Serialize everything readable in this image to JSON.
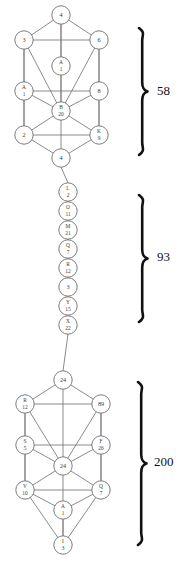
{
  "figure": {
    "background_color": "#ffffff",
    "line_color": "#767676",
    "node_fill": "#ffffff",
    "text_color": "#3a3a3a",
    "brace_color": "#111111"
  },
  "groups": [
    {
      "id": "group-top",
      "name": "upper-tree",
      "layout": "tree-of-life",
      "brace": {
        "glyph": "}",
        "value": "58"
      },
      "nodes": [
        {
          "id": "t1",
          "letter": "",
          "number": "4",
          "label": "4",
          "x": 61,
          "y": 15
        },
        {
          "id": "t2",
          "letter": "",
          "number": "3",
          "label": "3",
          "x": 24,
          "y": 40
        },
        {
          "id": "t3",
          "letter": "",
          "number": "6",
          "label": "6",
          "x": 99,
          "y": 40
        },
        {
          "id": "t4",
          "letter": "A",
          "number": "1",
          "label": "A 1",
          "x": 61,
          "y": 66
        },
        {
          "id": "t5",
          "letter": "A",
          "number": "1",
          "label": "A 1",
          "x": 24,
          "y": 91
        },
        {
          "id": "t6",
          "letter": "",
          "number": "8",
          "label": "8",
          "x": 99,
          "y": 91
        },
        {
          "id": "t7",
          "letter": "B",
          "number": "20",
          "label": "B 20",
          "x": 61,
          "y": 111
        },
        {
          "id": "t8",
          "letter": "",
          "number": "2",
          "label": "2",
          "x": 24,
          "y": 135
        },
        {
          "id": "t9",
          "letter": "K",
          "number": "9",
          "label": "K 9",
          "x": 99,
          "y": 135
        },
        {
          "id": "t10",
          "letter": "",
          "number": "4",
          "label": "4",
          "x": 61,
          "y": 158
        }
      ],
      "edges": [
        [
          "t1",
          "t2"
        ],
        [
          "t1",
          "t3"
        ],
        [
          "t1",
          "t4"
        ],
        [
          "t1",
          "t7"
        ],
        [
          "t2",
          "t3"
        ],
        [
          "t2",
          "t5"
        ],
        [
          "t2",
          "t7"
        ],
        [
          "t2",
          "t8"
        ],
        [
          "t3",
          "t6"
        ],
        [
          "t3",
          "t7"
        ],
        [
          "t3",
          "t9"
        ],
        [
          "t4",
          "t7"
        ],
        [
          "t5",
          "t6"
        ],
        [
          "t5",
          "t7"
        ],
        [
          "t5",
          "t8"
        ],
        [
          "t6",
          "t7"
        ],
        [
          "t6",
          "t9"
        ],
        [
          "t7",
          "t8"
        ],
        [
          "t7",
          "t9"
        ],
        [
          "t7",
          "t10"
        ],
        [
          "t8",
          "t9"
        ],
        [
          "t8",
          "t10"
        ],
        [
          "t9",
          "t10"
        ]
      ]
    },
    {
      "id": "group-middle",
      "name": "middle-chain",
      "layout": "vertical-chain",
      "brace": {
        "glyph": "}",
        "value": "93"
      },
      "nodes": [
        {
          "id": "m1",
          "letter": "L",
          "number": "2",
          "label": "L 2",
          "x": 68,
          "y": 192
        },
        {
          "id": "m2",
          "letter": "O",
          "number": "11",
          "label": "O 11",
          "x": 68,
          "y": 211
        },
        {
          "id": "m3",
          "letter": "M",
          "number": "21",
          "label": "M 21",
          "x": 68,
          "y": 230
        },
        {
          "id": "m4",
          "letter": "Q",
          "number": "7",
          "label": "Q 7",
          "x": 68,
          "y": 249
        },
        {
          "id": "m5",
          "letter": "R",
          "number": "12",
          "label": "R 12",
          "x": 68,
          "y": 268
        },
        {
          "id": "m6",
          "letter": "",
          "number": "3",
          "label": "3",
          "x": 68,
          "y": 287
        },
        {
          "id": "m7",
          "letter": "Y",
          "number": "15",
          "label": "Y 15",
          "x": 68,
          "y": 306
        },
        {
          "id": "m8",
          "letter": "X",
          "number": "22",
          "label": "X 22",
          "x": 68,
          "y": 325
        }
      ],
      "edges": [
        [
          "m1",
          "m2"
        ],
        [
          "m2",
          "m3"
        ],
        [
          "m3",
          "m4"
        ],
        [
          "m4",
          "m5"
        ],
        [
          "m5",
          "m6"
        ],
        [
          "m6",
          "m7"
        ],
        [
          "m7",
          "m8"
        ]
      ]
    },
    {
      "id": "group-bottom",
      "name": "lower-tree",
      "layout": "tree-of-life",
      "brace": {
        "glyph": "}",
        "value": "200"
      },
      "nodes": [
        {
          "id": "b1",
          "letter": "",
          "number": "24",
          "label": "24",
          "x": 63,
          "y": 380
        },
        {
          "id": "b2",
          "letter": "R",
          "number": "12",
          "label": "R 12",
          "x": 25,
          "y": 404
        },
        {
          "id": "b3",
          "letter": "",
          "number": "89",
          "label": "89",
          "x": 101,
          "y": 404
        },
        {
          "id": "b4",
          "letter": "S",
          "number": "5",
          "label": "S 5",
          "x": 25,
          "y": 445
        },
        {
          "id": "b5",
          "letter": "F",
          "number": "26",
          "label": "F 26",
          "x": 101,
          "y": 445
        },
        {
          "id": "b6",
          "letter": "",
          "number": "24",
          "label": "24",
          "x": 63,
          "y": 466
        },
        {
          "id": "b7",
          "letter": "V",
          "number": "10",
          "label": "V 10",
          "x": 25,
          "y": 490
        },
        {
          "id": "b8",
          "letter": "Q",
          "number": "7",
          "label": "Q 7",
          "x": 101,
          "y": 490
        },
        {
          "id": "b9",
          "letter": "A",
          "number": "1",
          "label": "A 1",
          "x": 63,
          "y": 510
        },
        {
          "id": "b10",
          "letter": "I",
          "number": "3",
          "label": "I 3",
          "x": 63,
          "y": 545
        }
      ],
      "edges": [
        [
          "b1",
          "b2"
        ],
        [
          "b1",
          "b3"
        ],
        [
          "b1",
          "b6"
        ],
        [
          "b2",
          "b3"
        ],
        [
          "b2",
          "b4"
        ],
        [
          "b2",
          "b6"
        ],
        [
          "b2",
          "b7"
        ],
        [
          "b3",
          "b5"
        ],
        [
          "b3",
          "b6"
        ],
        [
          "b3",
          "b8"
        ],
        [
          "b4",
          "b5"
        ],
        [
          "b4",
          "b6"
        ],
        [
          "b4",
          "b7"
        ],
        [
          "b5",
          "b6"
        ],
        [
          "b5",
          "b8"
        ],
        [
          "b6",
          "b7"
        ],
        [
          "b6",
          "b8"
        ],
        [
          "b6",
          "b9"
        ],
        [
          "b7",
          "b8"
        ],
        [
          "b7",
          "b9"
        ],
        [
          "b7",
          "b10"
        ],
        [
          "b8",
          "b9"
        ],
        [
          "b8",
          "b10"
        ],
        [
          "b9",
          "b10"
        ]
      ]
    }
  ],
  "braces": [
    {
      "id": "brace-58",
      "glyph": "}",
      "value": "58",
      "x": 140,
      "y_top": 28,
      "y_bottom": 155,
      "value_x": 157,
      "value_y": 92
    },
    {
      "id": "brace-93",
      "glyph": "}",
      "value": "93",
      "x": 140,
      "y_top": 195,
      "y_bottom": 322,
      "value_x": 157,
      "value_y": 258
    },
    {
      "id": "brace-200",
      "glyph": "}",
      "value": "200",
      "x": 139,
      "y_top": 382,
      "y_bottom": 545,
      "value_x": 154,
      "value_y": 463
    }
  ]
}
